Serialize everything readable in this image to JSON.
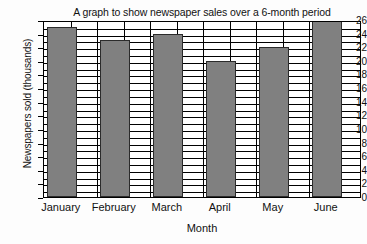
{
  "chart_data": {
    "type": "bar",
    "title": "A graph to show newspaper sales over a 6-month period",
    "xlabel": "Month",
    "ylabel": "Newspapers sold (thousands)",
    "categories": [
      "January",
      "February",
      "March",
      "April",
      "May",
      "June"
    ],
    "values": [
      25,
      23,
      24,
      20,
      22,
      26
    ],
    "ylim": [
      0,
      26
    ],
    "ytick_step": 2,
    "yticks": [
      0,
      2,
      4,
      6,
      8,
      10,
      12,
      14,
      16,
      18,
      20,
      22,
      24,
      26
    ],
    "ytick_labels": [
      "0",
      "2",
      "4",
      "6",
      "8",
      "10",
      "12",
      "14",
      "16",
      "18",
      "20",
      "22",
      "24",
      "26"
    ],
    "minor_gridline_step": 1,
    "grid": true,
    "legend": false,
    "bar_color": "#808080",
    "bar_border_color": "#2b2b2b",
    "grid_color": "#000000",
    "plot_background": "#ffffff",
    "page_background": "#fdfdfd"
  }
}
